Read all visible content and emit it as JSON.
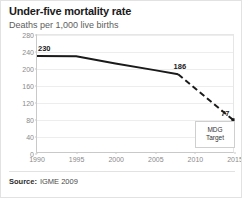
{
  "header": {
    "title": "Under-five mortality rate",
    "subtitle": "Deaths per 1,000 live births"
  },
  "footer": {
    "source_label": "Source:",
    "source_value": "IGME 2009"
  },
  "callout": {
    "line1": "MDG",
    "line2": "Target"
  },
  "chart_data": {
    "type": "line",
    "title": "Under-five mortality rate",
    "subtitle": "Deaths per 1,000 live births",
    "xlabel": "",
    "ylabel": "Deaths per 1,000 live births",
    "xlim": [
      1990,
      2015
    ],
    "ylim": [
      0,
      280
    ],
    "yticks": [
      0,
      40,
      80,
      120,
      160,
      200,
      240,
      280
    ],
    "ytick_labels": [
      "0",
      "40",
      "80",
      "120",
      "160",
      "200",
      "240",
      "280"
    ],
    "xticks": [
      1990,
      1995,
      2000,
      2005,
      2010,
      2015
    ],
    "xtick_labels": [
      "1990",
      "1995",
      "2000",
      "2005",
      "2010",
      "2015"
    ],
    "grid": true,
    "legend": "none",
    "series": [
      {
        "name": "Observed under-five mortality rate",
        "style": "solid",
        "color": "#1a1a1a",
        "x": [
          1990,
          1995,
          2000,
          2005,
          2008
        ],
        "values": [
          230,
          229,
          212,
          196,
          186
        ]
      },
      {
        "name": "Projection to MDG target",
        "style": "dashed",
        "color": "#1a1a1a",
        "x": [
          2008,
          2015
        ],
        "values": [
          186,
          77
        ]
      }
    ],
    "point_labels": [
      {
        "x": 1990,
        "value": 230,
        "text": "230"
      },
      {
        "x": 2008,
        "value": 186,
        "text": "186"
      },
      {
        "x": 2015,
        "value": 77,
        "text": "77"
      }
    ],
    "annotations": [
      {
        "text": "MDG Target",
        "x": 2015,
        "value": 77
      }
    ]
  }
}
